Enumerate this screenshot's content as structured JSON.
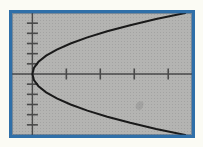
{
  "figure": {
    "caption": "",
    "screen_label": "graphing-calculator-screen",
    "bezel_color": "#2f6fa8",
    "screen_background_color": "#b4b4b2",
    "curve_color": "#1a1a1a",
    "axis_color": "#4a4a4a",
    "paper_color": "#fbfbf4"
  },
  "chart_data": {
    "type": "line",
    "title": "",
    "subtitle": "",
    "xlabel": "",
    "ylabel": "",
    "equation": "x = y^2",
    "relation": "x = y*y",
    "orientation": "opens-right",
    "vertex": [
      0,
      0
    ],
    "xlim": [
      -1.2,
      9.4
    ],
    "ylim": [
      -3.0,
      3.0
    ],
    "grid": false,
    "legend": null,
    "legend_position": "none",
    "axes": {
      "x_axis_visible": true,
      "y_axis_visible": true,
      "x_tick_values": [
        2,
        4,
        6,
        8
      ],
      "x_tick_labels": [
        "",
        "",
        "",
        ""
      ],
      "x_tick_count_positive": 4,
      "x_tick_count_negative": 0,
      "y_tick_values": [
        -2.5,
        -2.0,
        -1.5,
        -1.0,
        -0.5,
        0.5,
        1.0,
        1.5,
        2.0,
        2.5
      ],
      "y_tick_labels": [
        "",
        "",
        "",
        "",
        "",
        "",
        "",
        "",
        "",
        ""
      ],
      "y_tick_count_positive": 5,
      "y_tick_count_negative": 5,
      "tick_marks_only": true
    },
    "series": [
      {
        "name": "x = y^2",
        "color": "#1a1a1a",
        "style": "solid",
        "width": 2,
        "x": [
          9.0,
          7.29,
          5.76,
          4.41,
          3.24,
          2.25,
          1.44,
          0.81,
          0.36,
          0.09,
          0.0,
          0.09,
          0.36,
          0.81,
          1.44,
          2.25,
          3.24,
          4.41,
          5.76,
          7.29,
          9.0
        ],
        "y": [
          -3.0,
          -2.7,
          -2.4,
          -2.1,
          -1.8,
          -1.5,
          -1.2,
          -0.9,
          -0.6,
          -0.3,
          0.0,
          0.3,
          0.6,
          0.9,
          1.2,
          1.5,
          1.8,
          2.1,
          2.4,
          2.7,
          3.0
        ]
      }
    ],
    "annotations": []
  }
}
